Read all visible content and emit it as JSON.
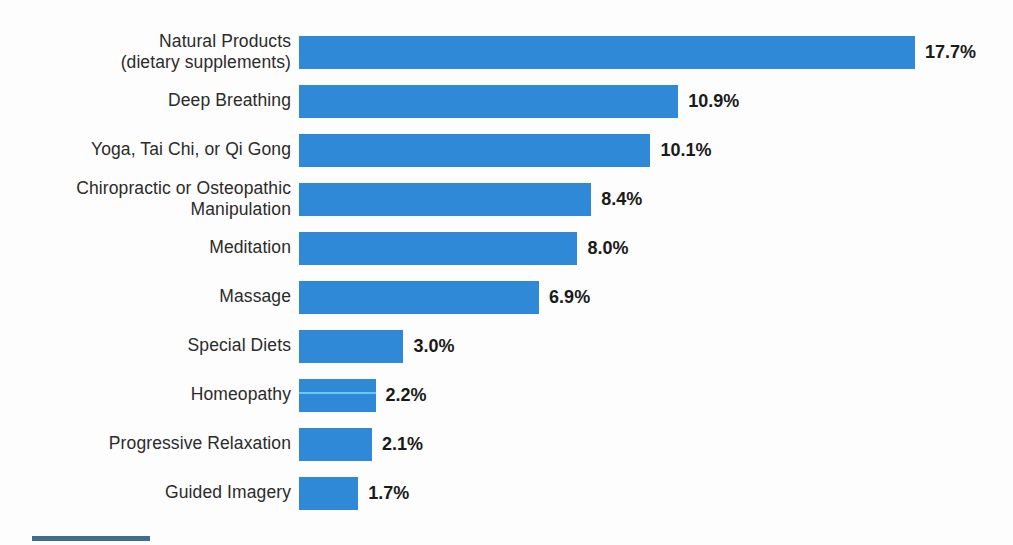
{
  "chart_data": {
    "type": "bar",
    "orientation": "horizontal",
    "title": "",
    "subtitle": "",
    "xlabel": "",
    "ylabel": "",
    "xlim": [
      0,
      17.7
    ],
    "grid": false,
    "legend": false,
    "value_suffix": "%",
    "bar_color": "#3089d6",
    "categories": [
      "Natural Products\n(dietary supplements)",
      "Deep Breathing",
      "Yoga, Tai Chi, or Qi Gong",
      "Chiropractic or Osteopathic\nManipulation",
      "Meditation",
      "Massage",
      "Special Diets",
      "Homeopathy",
      "Progressive Relaxation",
      "Guided Imagery"
    ],
    "values": [
      17.7,
      10.9,
      10.1,
      8.4,
      8.0,
      6.9,
      3.0,
      2.2,
      2.1,
      1.7
    ],
    "value_labels": [
      "17.7%",
      "10.9%",
      "10.1%",
      "8.4%",
      "8.0%",
      "6.9%",
      "3.0%",
      "2.2%",
      "2.1%",
      "1.7%"
    ]
  },
  "footer": {
    "rule_color": "#3d6e8f"
  }
}
